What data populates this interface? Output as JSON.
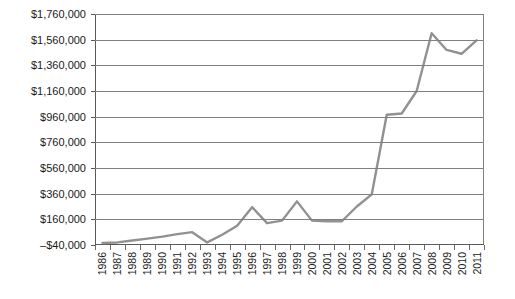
{
  "chart_data": {
    "type": "line",
    "title": "",
    "subtitle": "",
    "xlabel": "",
    "ylabel": "",
    "grid": true,
    "legend": false,
    "legend_position": "none",
    "line_color": "#919191",
    "gridline_color": "#808080",
    "axis_color": "#5a5a5a",
    "text_color": "#1a1a1a",
    "background_color": "#ffffff",
    "ylim": [
      -40000,
      1760000
    ],
    "ytick_step": 200000,
    "ytick_values": [
      -40000,
      160000,
      360000,
      560000,
      760000,
      960000,
      1160000,
      1360000,
      1560000,
      1760000
    ],
    "ytick_labels": [
      "–$40,000",
      "$160,000",
      "$360,000",
      "$560,000",
      "$760,000",
      "$960,000",
      "$1,160,000",
      "$1,360,000",
      "$1,560,000",
      "$1,760,000"
    ],
    "categories": [
      "1986",
      "1987",
      "1988",
      "1989",
      "1990",
      "1991",
      "1992",
      "1993",
      "1994",
      "1995",
      "1996",
      "1997",
      "1998",
      "1999",
      "2000",
      "2001",
      "2002",
      "2003",
      "2004",
      "2005",
      "2006",
      "2007",
      "2008",
      "2009",
      "2010",
      "2011"
    ],
    "values": [
      -25000,
      -20000,
      -5000,
      10000,
      25000,
      45000,
      60000,
      -20000,
      40000,
      110000,
      255000,
      130000,
      150000,
      300000,
      150000,
      145000,
      145000,
      260000,
      355000,
      975000,
      985000,
      1160000,
      1610000,
      1480000,
      1450000,
      1555000
    ],
    "series": [
      {
        "name": "",
        "values": [
          -25000,
          -20000,
          -5000,
          10000,
          25000,
          45000,
          60000,
          -20000,
          40000,
          110000,
          255000,
          130000,
          150000,
          300000,
          150000,
          145000,
          145000,
          260000,
          355000,
          975000,
          985000,
          1160000,
          1610000,
          1480000,
          1450000,
          1555000
        ]
      }
    ]
  }
}
